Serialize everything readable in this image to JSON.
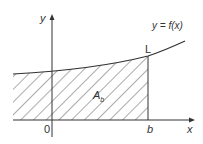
{
  "labels": {
    "y_axis": "y",
    "x_axis": "x",
    "function": "y = f(x)",
    "point": "L",
    "area": "A",
    "area_sub": "b",
    "origin": "0",
    "b": "b"
  },
  "colors": {
    "line": "#333333",
    "hatch": "#444444"
  }
}
